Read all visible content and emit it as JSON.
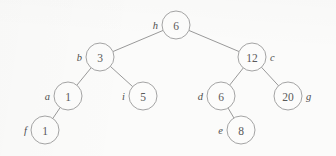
{
  "diagram": {
    "kind": "binary-tree",
    "canvas": {
      "width": 336,
      "height": 156
    },
    "style": {
      "background_color": "#fbfbfa",
      "edge_color": "#8d8d8d",
      "node_fill": "#fcfcfb",
      "node_stroke": "#9a9a9a",
      "value_text_color": "#5a5a5a",
      "label_text_color": "#4f4f4f",
      "node_radius": 14
    },
    "nodes": [
      {
        "id": "h",
        "label": "h",
        "value": "6",
        "x": 176,
        "y": 25,
        "r": 14,
        "label_side": "left",
        "depth": 0
      },
      {
        "id": "b",
        "label": "b",
        "value": "3",
        "x": 100,
        "y": 57,
        "r": 14,
        "label_side": "left",
        "depth": 1
      },
      {
        "id": "c",
        "label": "c",
        "value": "12",
        "x": 252,
        "y": 57,
        "r": 14,
        "label_side": "right",
        "depth": 1
      },
      {
        "id": "a",
        "label": "a",
        "value": "1",
        "x": 68,
        "y": 96,
        "r": 14,
        "label_side": "left",
        "depth": 2
      },
      {
        "id": "i",
        "label": "i",
        "value": "5",
        "x": 143,
        "y": 96,
        "r": 14,
        "label_side": "left",
        "depth": 2
      },
      {
        "id": "d",
        "label": "d",
        "value": "6",
        "x": 221,
        "y": 96,
        "r": 14,
        "label_side": "left",
        "depth": 2
      },
      {
        "id": "g",
        "label": "g",
        "value": "20",
        "x": 288,
        "y": 96,
        "r": 14,
        "label_side": "right",
        "depth": 2
      },
      {
        "id": "f",
        "label": "f",
        "value": "1",
        "x": 45,
        "y": 130,
        "r": 14,
        "label_side": "left",
        "depth": 3
      },
      {
        "id": "e",
        "label": "e",
        "value": "8",
        "x": 241,
        "y": 130,
        "r": 14,
        "label_side": "left",
        "depth": 3
      }
    ],
    "edges": [
      {
        "from": "h",
        "to": "b",
        "side": "left"
      },
      {
        "from": "h",
        "to": "c",
        "side": "right"
      },
      {
        "from": "b",
        "to": "a",
        "side": "left"
      },
      {
        "from": "b",
        "to": "i",
        "side": "right"
      },
      {
        "from": "c",
        "to": "d",
        "side": "left"
      },
      {
        "from": "c",
        "to": "g",
        "side": "right"
      },
      {
        "from": "a",
        "to": "f",
        "side": "left"
      },
      {
        "from": "d",
        "to": "e",
        "side": "right"
      }
    ]
  }
}
